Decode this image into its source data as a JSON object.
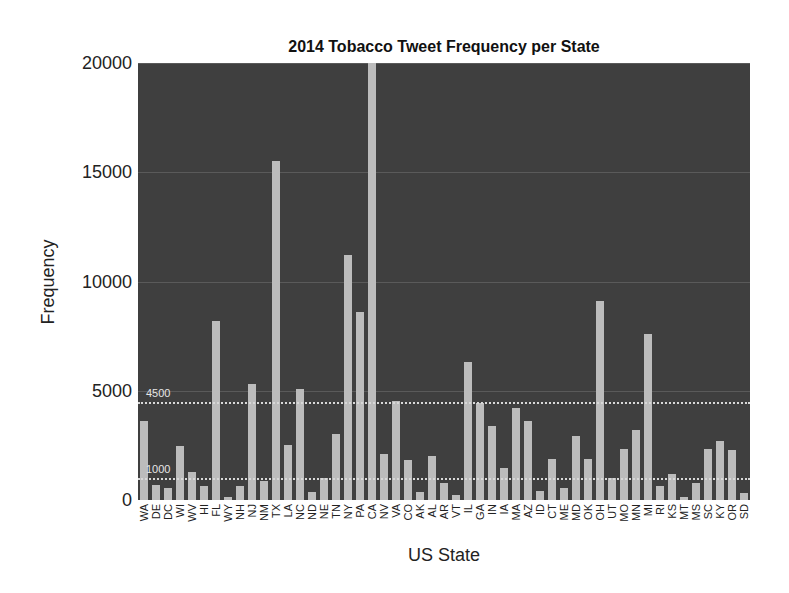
{
  "chart_data": {
    "type": "bar",
    "title": "2014 Tobacco Tweet Frequency per State",
    "xlabel": "US State",
    "ylabel": "Frequency",
    "ylim": [
      0,
      20000
    ],
    "yticks": [
      0,
      5000,
      10000,
      15000,
      20000
    ],
    "grid": true,
    "reference_lines": [
      {
        "value": 4500,
        "label": "4500",
        "style": "dotted"
      },
      {
        "value": 1000,
        "label": "1000",
        "style": "dotted"
      }
    ],
    "categories": [
      "WA",
      "DE",
      "DC",
      "WI",
      "WV",
      "HI",
      "FL",
      "WY",
      "NH",
      "NJ",
      "NM",
      "TX",
      "LA",
      "NC",
      "ND",
      "NE",
      "TN",
      "NY",
      "PA",
      "CA",
      "NV",
      "VA",
      "CO",
      "AK",
      "AL",
      "AR",
      "VT",
      "IL",
      "GA",
      "IN",
      "IA",
      "MA",
      "AZ",
      "ID",
      "CT",
      "ME",
      "MD",
      "OK",
      "OH",
      "UT",
      "MO",
      "MN",
      "MI",
      "RI",
      "KS",
      "MT",
      "MS",
      "SC",
      "KY",
      "OR",
      "SD"
    ],
    "values": [
      3600,
      700,
      550,
      2450,
      1300,
      650,
      8200,
      150,
      650,
      5300,
      850,
      15500,
      2500,
      5100,
      350,
      1000,
      3000,
      11200,
      8600,
      20000,
      2100,
      4550,
      1850,
      350,
      2000,
      800,
      250,
      6300,
      4450,
      3400,
      1450,
      4200,
      3600,
      400,
      1900,
      550,
      2950,
      1900,
      9100,
      1000,
      2350,
      3200,
      7600,
      650,
      1200,
      150,
      800,
      2350,
      2700,
      2300,
      300
    ],
    "colors": {
      "background": "#3f3f3f",
      "bar": "#bcbcbc",
      "reference_line": "#d8d8d8"
    }
  }
}
